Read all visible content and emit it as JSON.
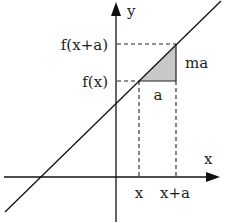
{
  "diagram": {
    "axes": {
      "x_label": "x",
      "y_label": "y"
    },
    "y_ticks": [
      {
        "label": "f(x+a)"
      },
      {
        "label": "f(x)"
      }
    ],
    "x_ticks": [
      {
        "label": "x"
      },
      {
        "label": "x+a"
      }
    ],
    "triangle": {
      "run_label": "a",
      "rise_label": "ma",
      "fill_color": "#c8c8c8"
    },
    "line_color": "#111111"
  }
}
